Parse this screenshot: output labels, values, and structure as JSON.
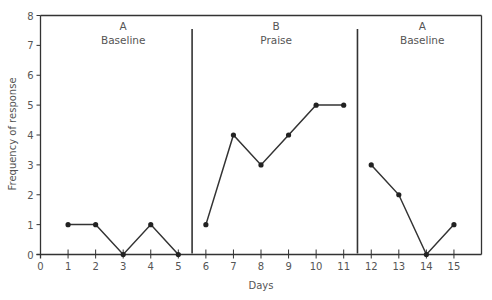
{
  "chart_data": {
    "type": "line",
    "title": "",
    "xlabel": "Days",
    "ylabel": "Frequency of response",
    "xlim": [
      0,
      16
    ],
    "ylim": [
      0,
      8
    ],
    "x_ticks": [
      0,
      1,
      2,
      3,
      4,
      5,
      6,
      7,
      8,
      9,
      10,
      11,
      12,
      13,
      14,
      15
    ],
    "y_ticks": [
      0,
      1,
      2,
      3,
      4,
      5,
      6,
      7,
      8
    ],
    "grid": false,
    "legend": null,
    "phase_change_lines": [
      5.5,
      11.5
    ],
    "phases": [
      {
        "letter": "A",
        "name": "Baseline",
        "days": [
          1,
          2,
          3,
          4,
          5
        ],
        "values": [
          1,
          1,
          0,
          1,
          0
        ]
      },
      {
        "letter": "B",
        "name": "Praise",
        "days": [
          6,
          7,
          8,
          9,
          10,
          11
        ],
        "values": [
          1,
          4,
          3,
          4,
          5,
          5
        ]
      },
      {
        "letter": "A",
        "name": "Baseline",
        "days": [
          12,
          13,
          14,
          15
        ],
        "values": [
          3,
          2,
          0,
          1
        ]
      }
    ],
    "series": [
      {
        "name": "Frequency of response",
        "x": [
          1,
          2,
          3,
          4,
          5,
          6,
          7,
          8,
          9,
          10,
          11,
          12,
          13,
          14,
          15
        ],
        "values": [
          1,
          1,
          0,
          1,
          0,
          1,
          4,
          3,
          4,
          5,
          5,
          3,
          2,
          0,
          1
        ]
      }
    ]
  },
  "colors": {
    "line": "#333333",
    "marker": "#222222",
    "axis": "#333333",
    "text": "#555555"
  }
}
